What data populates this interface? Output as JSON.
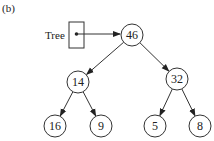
{
  "figure_label": "(b)",
  "pointer": {
    "label": "Tree",
    "points_to": "46"
  },
  "tree": {
    "nodes": [
      {
        "id": "n46",
        "value": "46",
        "cx": 132,
        "cy": 35
      },
      {
        "id": "n14",
        "value": "14",
        "cx": 78,
        "cy": 82
      },
      {
        "id": "n32",
        "value": "32",
        "cx": 177,
        "cy": 79
      },
      {
        "id": "n16",
        "value": "16",
        "cx": 55,
        "cy": 126
      },
      {
        "id": "n9",
        "value": "9",
        "cx": 101,
        "cy": 126
      },
      {
        "id": "n5",
        "value": "5",
        "cx": 155,
        "cy": 126
      },
      {
        "id": "n8",
        "value": "8",
        "cx": 200,
        "cy": 126
      }
    ],
    "edges": [
      {
        "from": "n46",
        "to": "n14"
      },
      {
        "from": "n46",
        "to": "n32"
      },
      {
        "from": "n14",
        "to": "n16"
      },
      {
        "from": "n14",
        "to": "n9"
      },
      {
        "from": "n32",
        "to": "n5"
      },
      {
        "from": "n32",
        "to": "n8"
      }
    ]
  },
  "colors": {
    "stroke": "#333333",
    "text": "#222222",
    "background": "#ffffff"
  }
}
